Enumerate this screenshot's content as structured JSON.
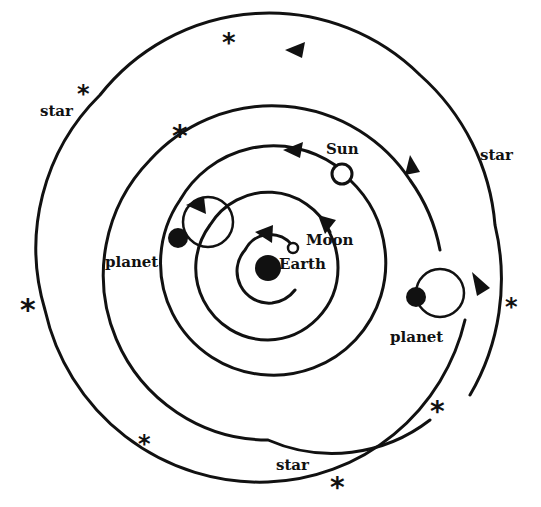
{
  "diagram": {
    "type": "geocentric spiral motion diagram",
    "labels": {
      "earth": "Earth",
      "moon": "Moon",
      "sun": "Sun",
      "planet_left": "planet",
      "planet_right": "planet",
      "star_top_left": "star",
      "star_right": "star",
      "star_bottom": "star"
    },
    "star_glyph": "*",
    "colors": {
      "ink": "#111111",
      "paper": "#ffffff"
    }
  }
}
